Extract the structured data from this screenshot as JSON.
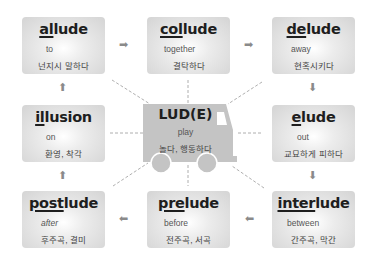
{
  "center": {
    "root": "LUD(E)",
    "meaning": "play",
    "korean": "놀다, 행동하다"
  },
  "boxes": [
    {
      "id": "allude",
      "prefix": "al",
      "suffix": "lude",
      "meaning": "to",
      "korean": "넌지시 말하다"
    },
    {
      "id": "collude",
      "prefix": "col",
      "suffix": "lude",
      "meaning": "together",
      "korean": "결탁하다"
    },
    {
      "id": "delude",
      "prefix": "de",
      "suffix": "lude",
      "meaning": "away",
      "korean": "현혹시키다"
    },
    {
      "id": "illusion",
      "prefix": "il",
      "suffix": "lusion",
      "meaning": "on",
      "korean": "환영, 착각"
    },
    {
      "id": "elude",
      "prefix": "e",
      "suffix": "lude",
      "meaning": "out",
      "korean": "교묘하게 피하다"
    },
    {
      "id": "postlude",
      "prefix": "post",
      "suffix": "lude",
      "meaning": "after",
      "korean": "후주곡, 결미"
    },
    {
      "id": "prelude",
      "prefix": "pre",
      "suffix": "lude",
      "meaning": "before",
      "korean": "전주곡, 서곡"
    },
    {
      "id": "interlude",
      "prefix": "inter",
      "suffix": "lude",
      "meaning": "between",
      "korean": "간주곡, 막간"
    }
  ],
  "arrows": {
    "right": "➡",
    "left": "⬅",
    "up": "⬆",
    "down": "⬇"
  },
  "colors": {
    "box_edge": "#d4d4d4",
    "truck": "#c4c4c4",
    "arrow": "#8a8a8a",
    "text": "#1e1e1e"
  }
}
